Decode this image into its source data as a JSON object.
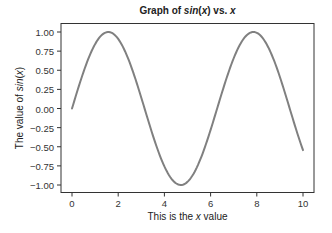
{
  "chart_data": {
    "type": "line",
    "title": "Graph of sin(x) vs. x",
    "title_parts": {
      "prefix": "Graph of ",
      "func": "sin",
      "lparen": "(",
      "var": "x",
      "rparen": ")",
      "mid": " vs. ",
      "var2": "x"
    },
    "xlabel": "This is the x value",
    "xlabel_parts": {
      "prefix": "This is the ",
      "var": "x",
      "suffix": " value"
    },
    "ylabel": "The value of sin(x)",
    "ylabel_parts": {
      "prefix": "The value of ",
      "func": "sin",
      "lparen": "(",
      "var": "x",
      "rparen": ")"
    },
    "xlim": [
      0,
      10
    ],
    "ylim": [
      -1.0,
      1.0
    ],
    "xticks": [
      "0",
      "2",
      "4",
      "6",
      "8",
      "10"
    ],
    "yticks": [
      "1.00",
      "0.75",
      "0.50",
      "0.25",
      "0.00",
      "−0.25",
      "−0.50",
      "−0.75",
      "−1.00"
    ],
    "grid": false,
    "legend": null,
    "series": [
      {
        "name": "sin(x)",
        "color": "#808080",
        "function": "sin(x)",
        "x": [
          0,
          0.5,
          1,
          1.5,
          1.5708,
          2,
          2.5,
          3,
          3.1416,
          3.5,
          4,
          4.5,
          4.7124,
          5,
          5.5,
          6,
          6.2832,
          6.5,
          7,
          7.5,
          7.854,
          8,
          8.5,
          9,
          9.4248,
          9.5,
          10
        ],
        "y": [
          0,
          0.479,
          0.841,
          0.997,
          1.0,
          0.909,
          0.598,
          0.141,
          0.0,
          -0.351,
          -0.757,
          -0.978,
          -1.0,
          -0.959,
          -0.706,
          -0.279,
          0.0,
          0.215,
          0.657,
          0.938,
          1.0,
          0.989,
          0.798,
          0.412,
          0.0,
          -0.075,
          -0.544
        ]
      }
    ]
  },
  "style": {
    "line_color": "#808080",
    "axis_color": "#333333",
    "text_color": "#222222"
  }
}
